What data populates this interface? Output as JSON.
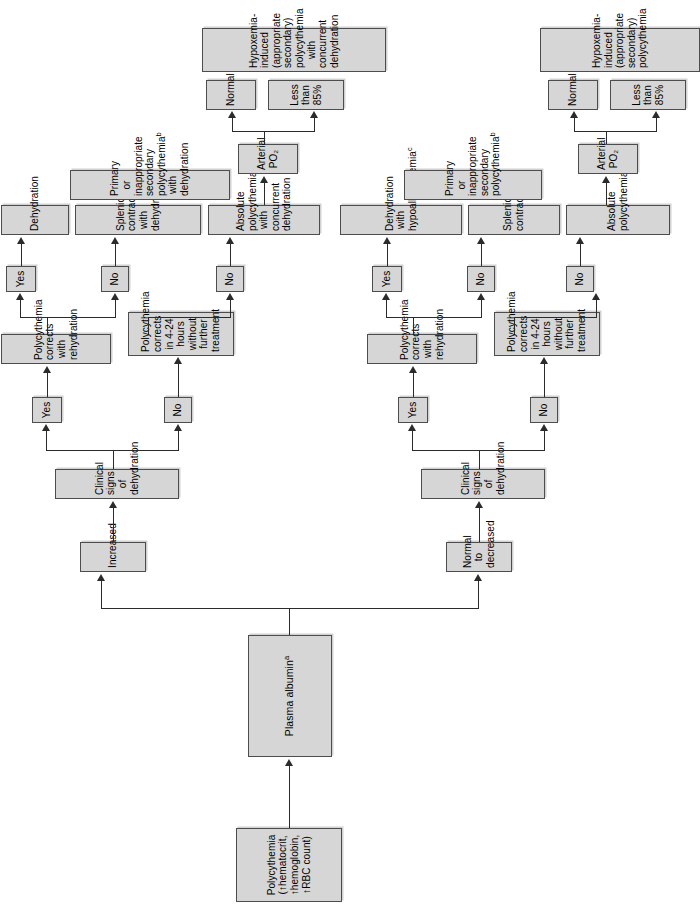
{
  "diagram": {
    "type": "flowchart",
    "orientation": "rotated-90-counterclockwise",
    "colors": {
      "node_fill": "#d6d6d6",
      "node_border": "#4d4d4d",
      "connector": "#2b2b2b",
      "background": "#ffffff"
    },
    "nodes": {
      "start": "Polycythemia\n(↑hematocrit,\n↑hemoglobin,\n↑RBC count)",
      "plasma_albumin": "Plasma albumin",
      "plasma_albumin_sup": "a",
      "branch_increased": "Increased",
      "branch_normal_decreased": "Normal to\ndecreased",
      "top_clinical_signs": "Clinical signs of dehydration",
      "top_yes_1": "Yes",
      "top_no_1": "No",
      "top_corrects_rehydration": "Polycythemia corrects with rehydration",
      "top_yes_2": "Yes",
      "top_no_2": "No",
      "top_dehydration": "Dehydration",
      "top_splenic_dehydration": "Splenic contraction with dehydration",
      "top_primary_inappropriate": "Primary or inappropriate secondary polycythemia",
      "top_primary_inappropriate_sup": "b",
      "top_primary_inappropriate_tail": " with dehydration",
      "top_corrects_4_24": "Polycythemia corrects in 4-24 hours without further treatment",
      "top_no_3": "No",
      "top_absolute_concurrent": "Absolute polycythemia with concurrent dehydration",
      "top_arterial_po2": "Arterial PO₂",
      "top_normal": "Normal",
      "top_less_than_85": "Less than 85%",
      "top_hypoxemia_induced": "Hypoxemia-induced (appropriate secondary) polycythemia with concurrent dehydration",
      "bot_clinical_signs": "Clinical signs of dehydration",
      "bot_yes_1": "Yes",
      "bot_no_1": "No",
      "bot_corrects_rehydration": "Polycythemia corrects with rehydration",
      "bot_yes_2": "Yes",
      "bot_no_2": "No",
      "bot_dehydration_hypoalb": "Dehydration with hypoalbuminemia",
      "bot_dehydration_hypoalb_sup": "c",
      "bot_splenic": "Splenic contraction",
      "bot_primary_inappropriate": "Primary or inappropriate secondary polycythemia",
      "bot_primary_inappropriate_sup": "b",
      "bot_corrects_4_24": "Polycythemia corrects in 4-24 hours without further treatment",
      "bot_no_3": "No",
      "bot_absolute": "Absolute polycythemia",
      "bot_arterial_po2": "Arterial PO₂",
      "bot_normal": "Normal",
      "bot_less_than_85": "Less than 85%",
      "bot_hypoxemia_induced": "Hypoxemia-induced (appropriate secondary) polycythemia"
    }
  }
}
